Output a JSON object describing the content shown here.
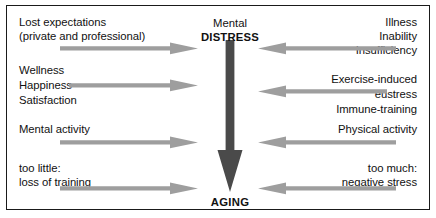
{
  "figure": {
    "center": {
      "top_label_line1": "Mental",
      "top_label_line2": "DISTRESS",
      "bottom_label": "AGING",
      "arrow_direction": "down",
      "arrow_color": "#4a4a4a"
    },
    "arrow_color": "#9e9e9e",
    "left_column": [
      {
        "lines": [
          "Lost expectations",
          "(private and professional)"
        ],
        "arrow_direction": "right"
      },
      {
        "lines": [
          "Wellness",
          "Happiness",
          "Satisfaction"
        ],
        "arrow_direction": "right"
      },
      {
        "lines": [
          "Mental activity"
        ],
        "arrow_direction": "right"
      },
      {
        "lines": [
          "too little:",
          "loss of training"
        ],
        "arrow_direction": "right"
      }
    ],
    "right_column": [
      {
        "lines": [
          "Illness",
          "Inability",
          "Insufficiency"
        ],
        "arrow_direction": "left"
      },
      {
        "lines": [
          "Exercise-induced",
          "eustress",
          "Immune-training"
        ],
        "arrow_direction": "left"
      },
      {
        "lines": [
          "Physical activity"
        ],
        "arrow_direction": "left"
      },
      {
        "lines": [
          "too much:",
          "negative stress"
        ],
        "arrow_direction": "left"
      }
    ]
  }
}
